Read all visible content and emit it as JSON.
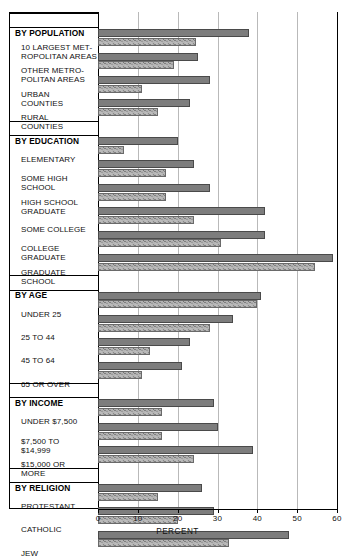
{
  "chart_data": {
    "type": "bar",
    "orientation": "horizontal",
    "title": "",
    "xlabel": "PERCENT",
    "ylabel": "",
    "xlim": [
      0,
      60
    ],
    "xticks": [
      0,
      10,
      20,
      30,
      40,
      50,
      60
    ],
    "grid": true,
    "legend": "none",
    "series": [
      {
        "name": "Series A",
        "style": "solid-gray",
        "color": "#7d7d7d",
        "values": [
          38,
          25,
          28,
          23,
          20,
          24,
          28,
          42,
          42,
          59,
          41,
          34,
          23,
          21,
          29,
          30,
          39,
          26,
          29,
          48
        ]
      },
      {
        "name": "Series B",
        "style": "speckled-gray",
        "color": "#b5b5b5",
        "values": [
          24.5,
          19,
          11,
          15,
          6.5,
          17,
          17,
          24,
          31,
          54.5,
          40,
          28,
          13,
          11,
          16,
          16,
          24,
          15,
          20,
          33
        ]
      }
    ],
    "groups": [
      {
        "heading": "BY POPULATION",
        "categories": [
          {
            "label_lines": [
              "10 LARGEST MET-",
              "ROPOLITAN AREAS"
            ],
            "a": 38,
            "b": 24.5
          },
          {
            "label_lines": [
              "OTHER METRO-",
              "POLITAN AREAS"
            ],
            "a": 25,
            "b": 19
          },
          {
            "label_lines": [
              "URBAN",
              "COUNTIES"
            ],
            "a": 28,
            "b": 11
          },
          {
            "label_lines": [
              "RURAL",
              "COUNTIES"
            ],
            "a": 23,
            "b": 15
          }
        ]
      },
      {
        "heading": "BY EDUCATION",
        "categories": [
          {
            "label_lines": [
              "ELEMENTARY"
            ],
            "a": 20,
            "b": 6.5
          },
          {
            "label_lines": [
              "SOME  HIGH",
              "SCHOOL"
            ],
            "a": 24,
            "b": 17
          },
          {
            "label_lines": [
              "HIGH SCHOOL",
              "GRADUATE"
            ],
            "a": 28,
            "b": 17
          },
          {
            "label_lines": [
              "SOME COLLEGE"
            ],
            "a": 42,
            "b": 24
          },
          {
            "label_lines": [
              "COLLEGE",
              "GRADUATE"
            ],
            "a": 42,
            "b": 31
          },
          {
            "label_lines": [
              "GRADUATE",
              "SCHOOL"
            ],
            "a": 59,
            "b": 54.5
          }
        ]
      },
      {
        "heading": "BY AGE",
        "categories": [
          {
            "label_lines": [
              "UNDER 25"
            ],
            "a": 41,
            "b": 40
          },
          {
            "label_lines": [
              "25 TO 44"
            ],
            "a": 34,
            "b": 28
          },
          {
            "label_lines": [
              "45 TO 64"
            ],
            "a": 23,
            "b": 13
          },
          {
            "label_lines": [
              "65 OR OVER"
            ],
            "a": 21,
            "b": 11
          }
        ]
      },
      {
        "heading": "BY INCOME",
        "categories": [
          {
            "label_lines": [
              "UNDER $7,500"
            ],
            "a": 29,
            "b": 16
          },
          {
            "label_lines": [
              "$7,500 TO",
              "$14,999"
            ],
            "a": 30,
            "b": 16
          },
          {
            "label_lines": [
              "$15,000 OR",
              "MORE"
            ],
            "a": 39,
            "b": 24
          },
          {
            "label_lines": [
              "PROTESTANT_PLACEHOLDER"
            ],
            "a": 0,
            "b": 0
          }
        ]
      },
      {
        "heading": "BY RELIGION",
        "categories": [
          {
            "label_lines": [
              "PROTESTANT"
            ],
            "a": 26,
            "b": 15
          },
          {
            "label_lines": [
              "CATHOLIC"
            ],
            "a": 29,
            "b": 20
          },
          {
            "label_lines": [
              "JEW"
            ],
            "a": 48,
            "b": 33
          }
        ]
      }
    ]
  },
  "axis": {
    "title": "PERCENT",
    "tick_labels": [
      "0",
      "10",
      "20",
      "30",
      "40",
      "50",
      "60"
    ]
  }
}
